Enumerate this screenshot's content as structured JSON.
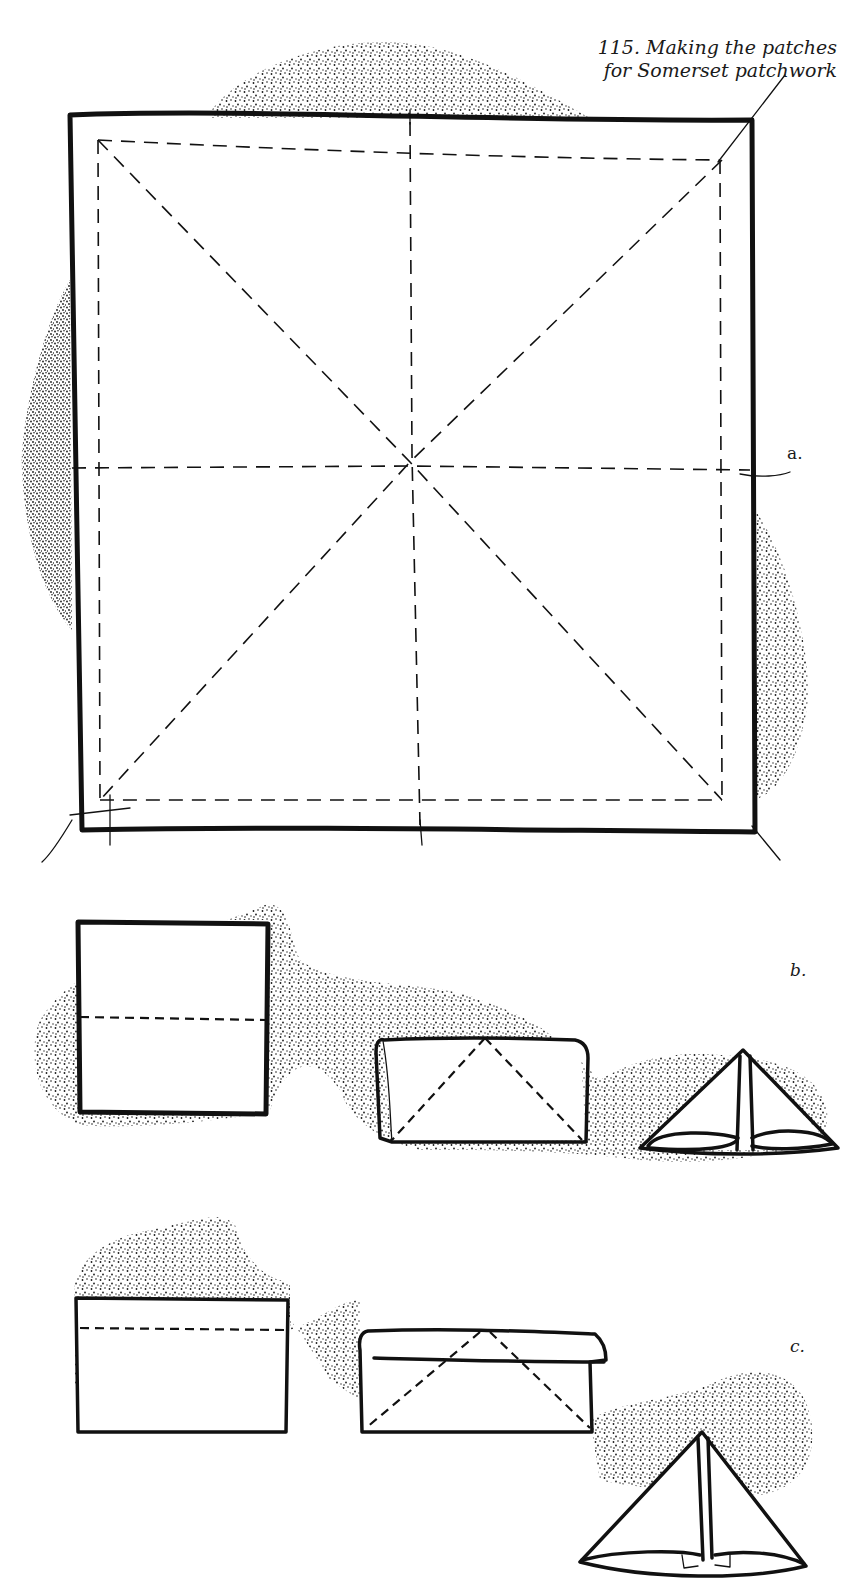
{
  "figure": {
    "number": "115.",
    "caption_line1": "115.  Making the patches",
    "caption_line2": "for Somerset patchwork",
    "steps": [
      {
        "label": "a.",
        "description": "Square patch with diagonal and centre fold lines (dashed) and seam allowance"
      },
      {
        "label": "b.",
        "description": "Square folded in half, then corners folded to centre to make triangle"
      },
      {
        "label": "c.",
        "description": "Rectangle with top edge folded over, then corners folded down to make triangle"
      }
    ]
  },
  "colors": {
    "ink": "#111111",
    "paper": "#ffffff",
    "stipple": "#1a1a1a"
  }
}
